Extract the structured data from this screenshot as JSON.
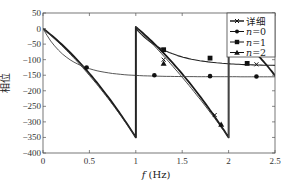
{
  "chart_data": {
    "type": "line",
    "title": "",
    "xlabel": "f (Hz)",
    "ylabel": "相位",
    "xlim": [
      0,
      2.5
    ],
    "ylim": [
      -400,
      50
    ],
    "xticks": [
      0,
      0.5,
      1,
      1.5,
      2,
      2.5
    ],
    "xtick_labels": [
      "0",
      "0.5",
      "1",
      "1.5",
      "2",
      "2.5"
    ],
    "yticks": [
      50,
      0,
      -50,
      -100,
      -150,
      -200,
      -250,
      -300,
      -350,
      -400
    ],
    "ytick_labels": [
      "50",
      "0",
      "-50",
      "-100",
      "-150",
      "-200",
      "-250",
      "-300",
      "-350",
      "-400"
    ],
    "grid": false,
    "legend_position": "upper right",
    "series": [
      {
        "name": "详细",
        "marker": "x",
        "x": [
          0,
          0.2,
          0.4,
          0.6,
          0.8,
          1.0,
          1.0,
          1.2,
          1.4,
          1.6,
          1.8,
          2.0,
          2.0,
          2.2,
          2.5
        ],
        "y": [
          0,
          -75,
          -140,
          -200,
          -275,
          -350,
          0,
          -75,
          -140,
          -205,
          -270,
          -350,
          0,
          -75,
          -165
        ]
      },
      {
        "name": "n=0",
        "marker": "circle",
        "x": [
          0,
          0.2,
          0.47,
          0.8,
          1.2,
          1.6,
          1.8,
          2.0,
          2.3,
          2.5
        ],
        "y": [
          0,
          -85,
          -125,
          -143,
          -150,
          -152,
          -153,
          -153,
          -154,
          -154
        ]
      },
      {
        "name": "n=1",
        "marker": "square",
        "x": [
          1.0,
          1.1,
          1.3,
          1.5,
          1.8,
          2.0,
          2.3,
          2.5
        ],
        "y": [
          0,
          -40,
          -75,
          -95,
          -108,
          -115,
          -117,
          -118
        ]
      },
      {
        "name": "n=2",
        "marker": "triangle",
        "x": [
          1.0,
          1.2,
          1.4,
          1.6,
          1.8,
          1.92,
          2.0
        ],
        "y": [
          0,
          -75,
          -150,
          -215,
          -280,
          -310,
          -350
        ]
      }
    ]
  },
  "legend": {
    "items": [
      {
        "label": "详细"
      },
      {
        "label": "n=0"
      },
      {
        "label": "n=1"
      },
      {
        "label": "n=2"
      }
    ]
  },
  "axes": {
    "xlabel": "f (Hz)",
    "ylabel": "相位"
  }
}
